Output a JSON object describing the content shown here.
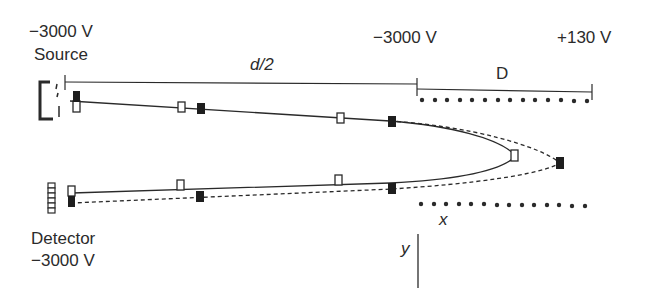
{
  "diagram": {
    "labels": {
      "source_voltage": "−3000 V",
      "source": "Source",
      "detector": "Detector",
      "detector_voltage": "−3000 V",
      "reflectron_entrance_voltage": "−3000 V",
      "reflectron_end_voltage": "+130 V",
      "drift_length": "d/2",
      "reflectron_depth": "D",
      "x_axis": "x",
      "y_axis": "y"
    },
    "components": [
      {
        "name": "ion-source",
        "shape": "bracket"
      },
      {
        "name": "detector",
        "shape": "stacked-plates"
      },
      {
        "name": "reflectron-grid-top",
        "shape": "dotted-row",
        "dots": 14
      },
      {
        "name": "reflectron-grid-bottom",
        "shape": "dotted-row",
        "dots": 14
      }
    ],
    "ion_paths": [
      {
        "name": "slow-ion-path",
        "style": "solid",
        "marker": "open-square"
      },
      {
        "name": "fast-ion-path",
        "style": "dashed",
        "marker": "filled-square"
      }
    ],
    "colors": {
      "ink": "#2a2a2a",
      "background": "#ffffff"
    }
  }
}
